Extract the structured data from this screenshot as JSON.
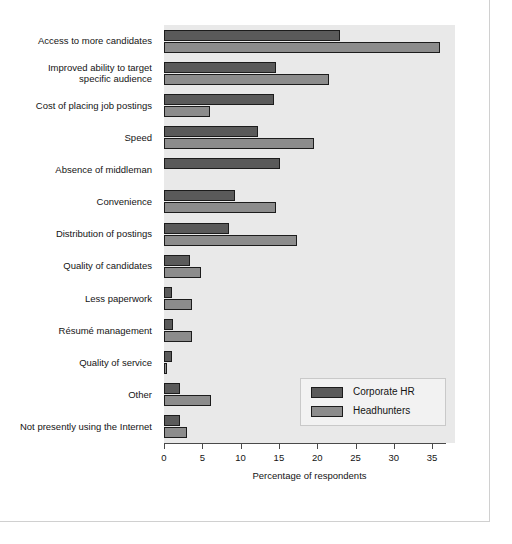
{
  "chart_data": {
    "type": "bar",
    "orientation": "horizontal",
    "title": "",
    "xlabel": "Percentage of respondents",
    "ylabel": "",
    "xlim": [
      0,
      38
    ],
    "xticks": [
      0,
      5,
      10,
      15,
      20,
      25,
      30,
      35
    ],
    "grid": false,
    "legend_position": "lower right",
    "categories": [
      "Access to more candidates",
      "Improved ability to target\nspecific audience",
      "Cost of placing job postings",
      "Speed",
      "Absence of middleman",
      "Convenience",
      "Distribution of postings",
      "Quality of candidates",
      "Less paperwork",
      "Résumé management",
      "Quality of service",
      "Other",
      "Not presently using the Internet"
    ],
    "series": [
      {
        "name": "Corporate HR",
        "color": "#5a5a5a",
        "values": [
          23,
          14.6,
          14.4,
          12.3,
          15.1,
          9.3,
          8.5,
          3.4,
          1.0,
          1.2,
          1.0,
          2.1,
          2.1
        ]
      },
      {
        "name": "Headhunters",
        "color": "#8c8c8c",
        "values": [
          36,
          21.5,
          6.0,
          19.6,
          0,
          14.6,
          17.4,
          4.8,
          3.7,
          3.7,
          0.4,
          6.2,
          3.0
        ]
      }
    ]
  },
  "legend": {
    "entries": [
      {
        "label": "Corporate HR"
      },
      {
        "label": "Headhunters"
      }
    ]
  },
  "axis": {
    "title": "Percentage of respondents",
    "tick_labels": [
      "0",
      "5",
      "10",
      "15",
      "20",
      "25",
      "30",
      "35"
    ]
  },
  "colors": {
    "corporate_hr": "#5a5a5a",
    "headhunters": "#8c8c8c",
    "plot_background": "#e9e9e9",
    "bar_outline": "#1c1c1c",
    "frame": "#d0d0d0"
  }
}
